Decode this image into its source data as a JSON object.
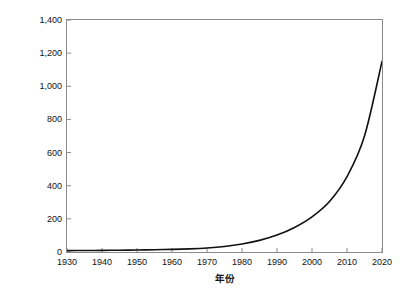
{
  "chart_data": {
    "type": "line",
    "title": "",
    "xlabel": "年份",
    "ylabel": "高度超过 200 米的建筑的数量（座）",
    "xlim": [
      1930,
      2020
    ],
    "ylim": [
      0,
      1400
    ],
    "grid": false,
    "legend": "none",
    "xticklabels": [
      "1930",
      "1940",
      "1950",
      "1960",
      "1970",
      "1980",
      "1990",
      "2000",
      "2010",
      "2020"
    ],
    "xtickvalues": [
      1930,
      1940,
      1950,
      1960,
      1970,
      1980,
      1990,
      2000,
      2010,
      2020
    ],
    "yticklabels": [
      "0",
      "200",
      "400",
      "600",
      "800",
      "1,000",
      "1,200",
      "1,400"
    ],
    "ytickvalues": [
      0,
      200,
      400,
      600,
      800,
      1000,
      1200,
      1400
    ],
    "line_color": "#111111",
    "axis_color": "#8a8a8a",
    "x": [
      1930,
      1935,
      1940,
      1945,
      1950,
      1955,
      1960,
      1965,
      1970,
      1975,
      1980,
      1985,
      1990,
      1995,
      2000,
      2005,
      2010,
      2015,
      2020
    ],
    "values": [
      8,
      9,
      10,
      11,
      12,
      14,
      16,
      19,
      24,
      33,
      48,
      70,
      102,
      148,
      212,
      305,
      455,
      700,
      1150
    ],
    "series": [
      {
        "name": "高度超过 200 米的建筑的数量",
        "values": [
          8,
          9,
          10,
          11,
          12,
          14,
          16,
          19,
          24,
          33,
          48,
          70,
          102,
          148,
          212,
          305,
          455,
          700,
          1150
        ]
      }
    ],
    "annotations": []
  }
}
